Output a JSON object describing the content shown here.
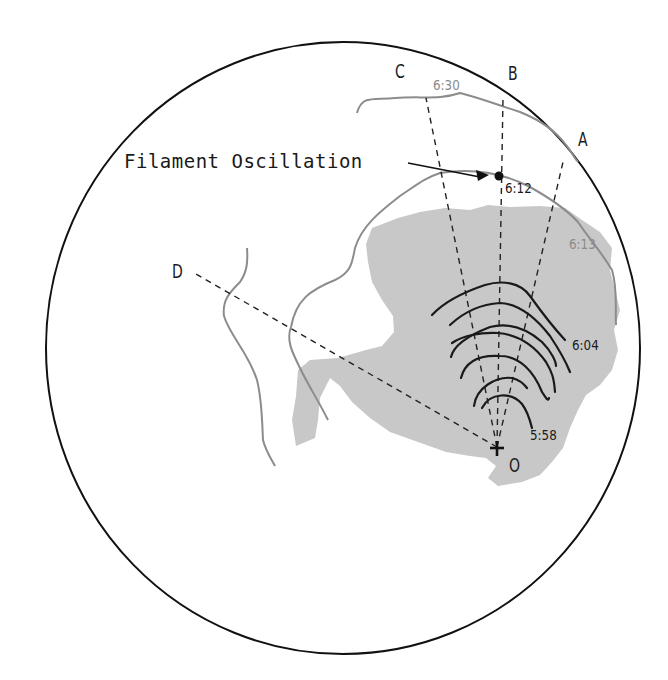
{
  "diagram": {
    "disk": {
      "cx": 343,
      "cy": 348,
      "rx": 297,
      "ry": 306,
      "stroke": "#111111"
    },
    "colors": {
      "region_fill": "#c8c8c8",
      "neutral_line": "#8c8c8c",
      "wavefront": "#1a1a1a",
      "dashed": "#222222"
    },
    "origin": {
      "label": "O",
      "x": 497,
      "y": 447
    },
    "radial_lines": [
      {
        "label": "A",
        "to_x": 563,
        "to_y": 162
      },
      {
        "label": "B",
        "to_x": 503,
        "to_y": 98
      },
      {
        "label": "C",
        "to_x": 426,
        "to_y": 98
      },
      {
        "label": "D",
        "to_x": 196,
        "to_y": 274
      }
    ],
    "labels": {
      "A": "A",
      "B": "B",
      "C": "C",
      "D": "D",
      "O": "O",
      "filament_oscillation": "Filament Oscillation"
    },
    "times": {
      "t630": "6:30",
      "t612": "6:12",
      "t613": "6:13",
      "t604": "6:04",
      "t558": "5:58"
    },
    "filament_point": {
      "x": 499,
      "y": 176
    },
    "wavefront_count": 7,
    "wavefront_times_range": [
      "5:58",
      "6:04"
    ]
  }
}
